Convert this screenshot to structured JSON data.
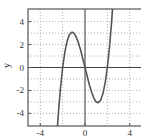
{
  "chart_data": {
    "type": "line",
    "title": "",
    "xlabel": "",
    "ylabel": "y",
    "function": "x^3 - 4x",
    "xlim": [
      -5.1,
      5.1
    ],
    "ylim": [
      -5.1,
      5.1
    ],
    "xticks": [
      -4,
      0,
      4
    ],
    "xtick_labels": [
      "-4",
      "0",
      "4"
    ],
    "yticks": [
      -4,
      -2,
      0,
      2,
      4
    ],
    "ytick_labels": [
      "-4",
      "-2",
      "0",
      "2",
      "4"
    ],
    "x_gridlines": [
      -4,
      -2,
      2,
      4
    ],
    "y_gridlines": [
      -4,
      -3,
      -2,
      -1,
      1,
      2,
      3,
      4
    ],
    "grid": true,
    "grid_style": "dotted",
    "zero_axes": true,
    "series": [
      {
        "name": "y",
        "color": "#555555",
        "points": [
          {
            "x": -2.6,
            "y": -7.18
          },
          {
            "x": -2.4,
            "y": -4.22
          },
          {
            "x": -2.2,
            "y": -1.85
          },
          {
            "x": -2.0,
            "y": 0.0
          },
          {
            "x": -1.8,
            "y": 1.37
          },
          {
            "x": -1.6,
            "y": 2.3
          },
          {
            "x": -1.4,
            "y": 2.86
          },
          {
            "x": -1.155,
            "y": 3.08
          },
          {
            "x": -1.0,
            "y": 3.0
          },
          {
            "x": -0.8,
            "y": 2.69
          },
          {
            "x": -0.6,
            "y": 2.18
          },
          {
            "x": -0.4,
            "y": 1.54
          },
          {
            "x": -0.2,
            "y": 0.79
          },
          {
            "x": 0.0,
            "y": 0.0
          },
          {
            "x": 0.2,
            "y": -0.79
          },
          {
            "x": 0.4,
            "y": -1.54
          },
          {
            "x": 0.6,
            "y": -2.18
          },
          {
            "x": 0.8,
            "y": -2.69
          },
          {
            "x": 1.0,
            "y": -3.0
          },
          {
            "x": 1.155,
            "y": -3.08
          },
          {
            "x": 1.4,
            "y": -2.86
          },
          {
            "x": 1.6,
            "y": -2.3
          },
          {
            "x": 1.8,
            "y": -1.37
          },
          {
            "x": 2.0,
            "y": 0.0
          },
          {
            "x": 2.2,
            "y": 1.85
          },
          {
            "x": 2.4,
            "y": 4.22
          },
          {
            "x": 2.6,
            "y": 7.18
          }
        ]
      }
    ],
    "colors": {
      "frame": "#555555",
      "grid": "#9a9a9a",
      "zero_axes": "#444444",
      "curve": "#555555",
      "text": "#333333"
    }
  }
}
